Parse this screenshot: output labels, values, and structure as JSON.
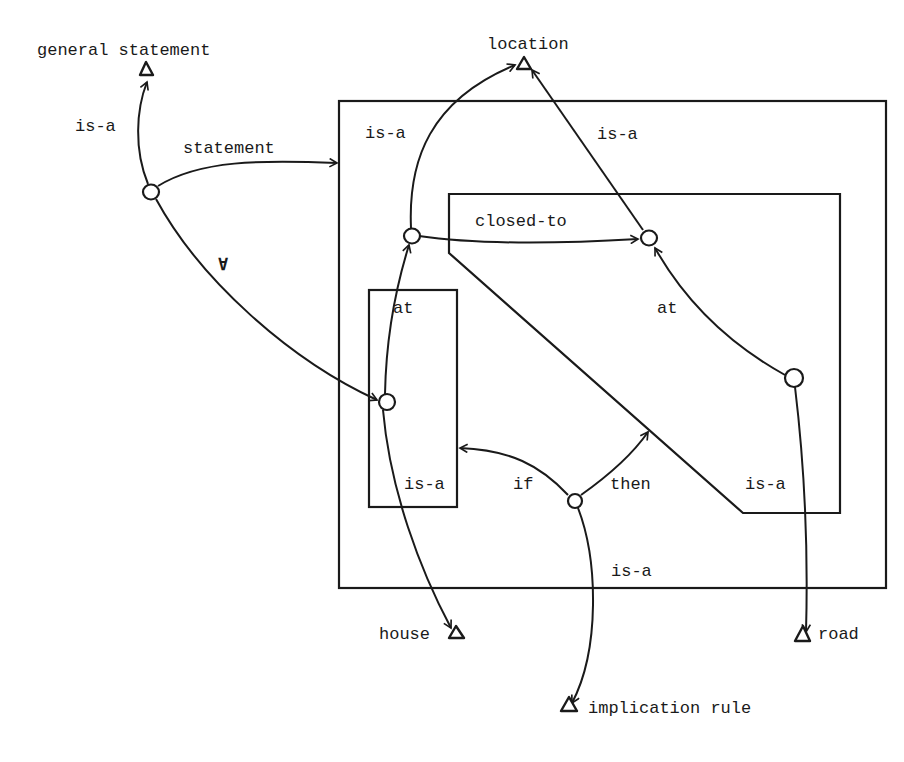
{
  "diagram": {
    "type": "partitioned semantic network",
    "concepts": {
      "general_statement": "general statement",
      "location": "location",
      "house": "house",
      "road": "road",
      "implication_rule": "implication rule"
    },
    "edge_labels": {
      "isa_general": "is-a",
      "statement": "statement",
      "forall": "∀",
      "isa_location_left": "is-a",
      "isa_location_right": "is-a",
      "closed_to": "closed-to",
      "at_left": "at",
      "at_right": "at",
      "isa_house": "is-a",
      "if": "if",
      "then": "then",
      "isa_road": "is-a",
      "isa_implication": "is-a"
    },
    "nodes": [
      {
        "id": "n_statement",
        "x": 151,
        "y": 192
      },
      {
        "id": "n_loc1",
        "x": 411,
        "y": 236
      },
      {
        "id": "n_loc2",
        "x": 648,
        "y": 238
      },
      {
        "id": "n_house",
        "x": 386,
        "y": 402
      },
      {
        "id": "n_road",
        "x": 793,
        "y": 378
      },
      {
        "id": "n_rule",
        "x": 575,
        "y": 500
      }
    ],
    "spaces": [
      {
        "id": "outer",
        "label": "statement space"
      },
      {
        "id": "antecedent",
        "label": "if space"
      },
      {
        "id": "consequent",
        "label": "then space"
      }
    ]
  }
}
